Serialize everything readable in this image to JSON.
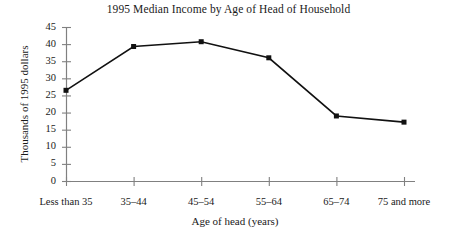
{
  "chart_data": {
    "type": "line",
    "title": "1995 Median Income by Age of Head of Household",
    "xlabel": "Age of head (years)",
    "ylabel": "Thousands of 1995 dollars",
    "categories": [
      "Less than 35",
      "35–44",
      "45–54",
      "55–64",
      "65–74",
      "75 and more"
    ],
    "values": [
      26.5,
      39.3,
      40.7,
      36.0,
      19.0,
      17.2
    ],
    "ylim": [
      0,
      45
    ],
    "yticks": [
      0,
      5,
      10,
      15,
      20,
      25,
      30,
      35,
      40,
      45
    ],
    "ytick_labels": [
      "0",
      "5",
      "10",
      "15",
      "20",
      "25",
      "30",
      "35",
      "40",
      "45"
    ],
    "grid": false,
    "legend": false,
    "marker": "square",
    "series_color": "#111111",
    "axis_color": "#808080",
    "background": "#ffffff"
  }
}
